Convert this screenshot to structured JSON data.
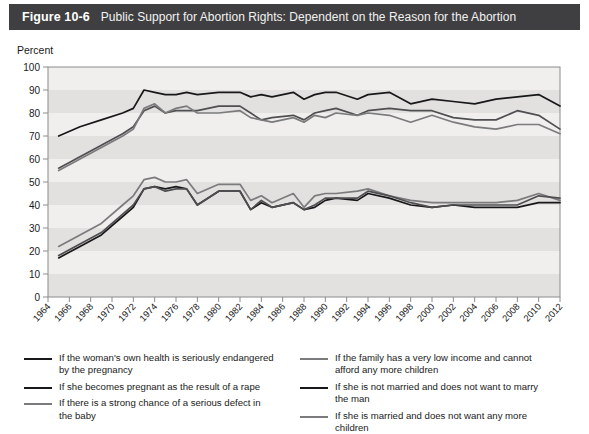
{
  "header": {
    "figure_number": "Figure 10-6",
    "title": "Public Support for Abortion Rights: Dependent on the Reason for the Abortion"
  },
  "colors": {
    "header_bg": "#3f3f41",
    "header_text": "#ffffff",
    "plot_bg": "#f0efed",
    "band": "#e2e1df",
    "axis": "#8c8c8c",
    "dark_line": "#18181a",
    "gray_line": "#7b7b7d",
    "mid_line": "#4f4f51"
  },
  "chart_data": {
    "type": "line",
    "title": "Public Support for Abortion Rights: Dependent on the Reason for the Abortion",
    "xlabel": "",
    "ylabel": "Percent",
    "ylim": [
      0,
      100
    ],
    "ytick_step": 10,
    "yticks": [
      0,
      10,
      20,
      30,
      40,
      50,
      60,
      70,
      80,
      90,
      100
    ],
    "xlim": [
      1964,
      2012
    ],
    "xticks": [
      1964,
      1966,
      1968,
      1970,
      1972,
      1974,
      1976,
      1978,
      1980,
      1982,
      1984,
      1986,
      1988,
      1990,
      1992,
      1994,
      1996,
      1998,
      2000,
      2002,
      2004,
      2006,
      2008,
      2010,
      2012
    ],
    "grid": false,
    "banded_background": true,
    "legend_position": "below",
    "x": [
      1965,
      1967,
      1969,
      1971,
      1972,
      1973,
      1974,
      1975,
      1976,
      1977,
      1978,
      1980,
      1982,
      1983,
      1984,
      1985,
      1987,
      1988,
      1989,
      1990,
      1991,
      1993,
      1994,
      1996,
      1998,
      2000,
      2002,
      2004,
      2006,
      2008,
      2010,
      2012
    ],
    "series": [
      {
        "name": "If the woman's own health is seriously endangered by the pregnancy",
        "color": "#18181a",
        "values": [
          70,
          74,
          77,
          80,
          82,
          90,
          89,
          88,
          88,
          89,
          88,
          89,
          89,
          87,
          88,
          87,
          89,
          86,
          88,
          89,
          89,
          86,
          88,
          89,
          84,
          86,
          85,
          84,
          86,
          87,
          88,
          83
        ]
      },
      {
        "name": "If she becomes pregnant as the result of a rape",
        "color": "#4f4f51",
        "values": [
          56,
          61,
          66,
          71,
          74,
          81,
          83,
          80,
          81,
          81,
          81,
          83,
          83,
          80,
          77,
          78,
          79,
          77,
          80,
          81,
          82,
          79,
          81,
          82,
          81,
          81,
          78,
          77,
          77,
          81,
          79,
          73
        ]
      },
      {
        "name": "If there is a strong chance of a serious defect in the baby",
        "color": "#7b7b7d",
        "values": [
          55,
          60,
          65,
          70,
          73,
          82,
          84,
          80,
          82,
          83,
          80,
          80,
          81,
          78,
          77,
          76,
          78,
          76,
          79,
          78,
          80,
          79,
          80,
          79,
          76,
          79,
          76,
          74,
          73,
          75,
          75,
          71
        ]
      },
      {
        "name": "If the family has a very low income and cannot afford any more children",
        "color": "#7b7b7d",
        "values": [
          22,
          27,
          32,
          40,
          44,
          51,
          52,
          50,
          50,
          51,
          45,
          49,
          49,
          42,
          44,
          41,
          45,
          39,
          44,
          45,
          45,
          46,
          47,
          44,
          42,
          41,
          41,
          41,
          41,
          42,
          45,
          42
        ]
      },
      {
        "name": "If she is not married and does not want to marry the man",
        "color": "#18181a",
        "values": [
          17,
          22,
          27,
          35,
          39,
          47,
          48,
          47,
          48,
          47,
          40,
          46,
          46,
          38,
          41,
          39,
          41,
          38,
          39,
          42,
          43,
          42,
          45,
          43,
          40,
          39,
          40,
          39,
          39,
          39,
          41,
          41
        ]
      },
      {
        "name": "If she is married and does not want any more children",
        "color": "#4f4f51",
        "values": [
          18,
          23,
          28,
          36,
          40,
          47,
          48,
          46,
          47,
          47,
          40,
          46,
          46,
          38,
          42,
          39,
          41,
          38,
          40,
          43,
          43,
          43,
          46,
          44,
          41,
          39,
          40,
          40,
          40,
          40,
          44,
          43
        ]
      }
    ]
  },
  "legend": {
    "left": [
      {
        "label": "If the woman's own health is seriously endangered by the pregnancy",
        "color": "#18181a"
      },
      {
        "label": "If she becomes pregnant as the result of a rape",
        "color": "#18181a"
      },
      {
        "label": "If there is a strong chance of a serious defect in the baby",
        "color": "#7b7b7d"
      }
    ],
    "right": [
      {
        "label": "If the family has a very low income and cannot afford any more children",
        "color": "#7b7b7d"
      },
      {
        "label": "If she is not married and does not want to marry the man",
        "color": "#18181a"
      },
      {
        "label": "If she is married and does not want any more children",
        "color": "#7b7b7d"
      }
    ]
  }
}
